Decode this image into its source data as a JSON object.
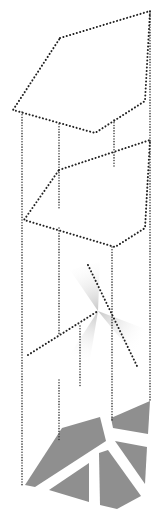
{
  "diagram": {
    "title": "",
    "colors": {
      "background": "#ffffff",
      "dotted_line": "#222222",
      "fragments": "#8f8f8f",
      "light_fan": "#cccccc"
    },
    "planes": [
      {
        "name": "upper-plane",
        "points": "60,38 150,11 145,101 95,133 13,110"
      },
      {
        "name": "middle-plane",
        "points": "59,170 150,140 145,228 115,247 24,220"
      }
    ],
    "verticals": [
      {
        "name": "vertical-left",
        "x1": 22,
        "y1": 112,
        "x2": 22,
        "y2": 485
      },
      {
        "name": "vertical-center-left-top",
        "x1": 59,
        "y1": 124,
        "x2": 59,
        "y2": 210
      },
      {
        "name": "vertical-center-left",
        "x1": 59,
        "y1": 228,
        "x2": 59,
        "y2": 335
      },
      {
        "name": "vertical-center-left-low",
        "x1": 59,
        "y1": 380,
        "x2": 59,
        "y2": 440
      },
      {
        "name": "vertical-center-right-top",
        "x1": 114,
        "y1": 120,
        "x2": 114,
        "y2": 166
      },
      {
        "name": "vertical-center-right",
        "x1": 112,
        "y1": 247,
        "x2": 112,
        "y2": 420
      },
      {
        "name": "vertical-right",
        "x1": 150,
        "y1": 11,
        "x2": 150,
        "y2": 401
      },
      {
        "name": "vertical-short",
        "x1": 80,
        "y1": 326,
        "x2": 80,
        "y2": 388
      }
    ],
    "crossing_lines": [
      {
        "name": "crossing-line-a",
        "x1": 28,
        "y1": 355,
        "x2": 98,
        "y2": 311
      },
      {
        "name": "crossing-line-b",
        "x1": 88,
        "y1": 265,
        "x2": 137,
        "y2": 366
      }
    ],
    "fragments": [
      {
        "name": "fragment-large-left",
        "points": "25,485 62,428 100,417 106,441 35,487"
      },
      {
        "name": "fragment-top-right",
        "points": "111,418 150,401 148,434 113,428"
      },
      {
        "name": "fragment-mid-right",
        "points": "115,441 147,447 145,484"
      },
      {
        "name": "fragment-bottom-left",
        "points": "49,490 89,463 89,502"
      },
      {
        "name": "fragment-bottom-center",
        "points": "99,453 108,450 141,496 117,509 100,505"
      }
    ],
    "light_fans": [
      {
        "name": "light-fan-upper",
        "points": "98,311 70,270 100,262"
      },
      {
        "name": "light-fan-right",
        "points": "98,311 148,330 138,360"
      },
      {
        "name": "light-fan-lower",
        "points": "98,311 60,370 85,390"
      }
    ]
  }
}
